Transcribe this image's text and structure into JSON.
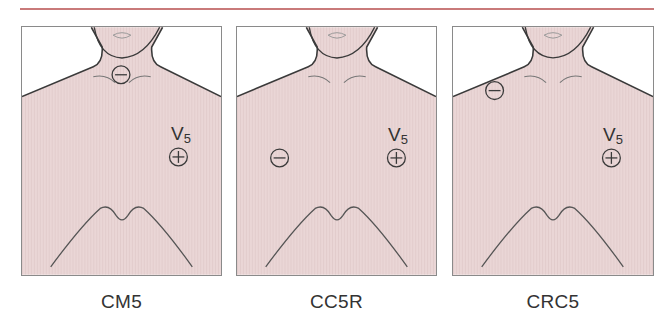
{
  "colors": {
    "rule": "#c97a7a",
    "skin": "#ead6d6",
    "outline": "#3a3a3a",
    "panel_border": "#8a8a8a"
  },
  "lead_label": {
    "main": "V",
    "sub": "5"
  },
  "electrodes": {
    "positive_symbol": "+",
    "negative_symbol": "−"
  },
  "panels": [
    {
      "caption": "CM5",
      "negative_electrode_site": "manubrium (sternal notch)",
      "positive_electrode_site": "V5"
    },
    {
      "caption": "CC5R",
      "negative_electrode_site": "right V5 position (right chest)",
      "positive_electrode_site": "V5"
    },
    {
      "caption": "CRC5",
      "negative_electrode_site": "right clavicle",
      "positive_electrode_site": "V5"
    }
  ]
}
